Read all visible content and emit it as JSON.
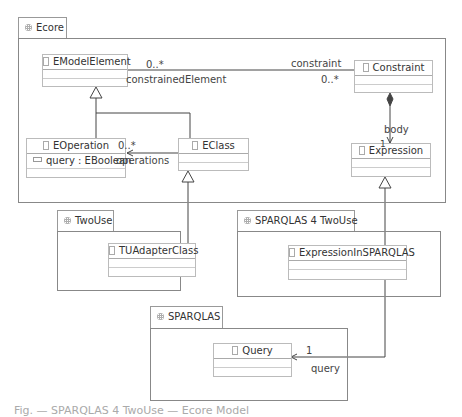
{
  "packages": {
    "ecore": {
      "name": "Ecore"
    },
    "twouse": {
      "name": "TwoUse"
    },
    "sparqlas4twouse": {
      "name": "SPARQLAS 4 TwoUse"
    },
    "sparqlas": {
      "name": "SPARQLAS"
    }
  },
  "classes": {
    "emodelelement": {
      "name": "EModelElement"
    },
    "constraint": {
      "name": "Constraint"
    },
    "eoperation": {
      "name": "EOperation",
      "attributes": [
        "query : EBoolean"
      ]
    },
    "eclass": {
      "name": "EClass"
    },
    "expression": {
      "name": "Expression"
    },
    "tuadapterclass": {
      "name": "TUAdapterClass"
    },
    "expressioninsparqlas": {
      "name": "ExpressionInSPARQLAS"
    },
    "query": {
      "name": "Query"
    }
  },
  "associations": {
    "constraint_assoc": {
      "source_multiplicity": "0..*",
      "source_role": "constrainedElement",
      "target_role": "constraint",
      "target_multiplicity": "0..*"
    },
    "body_assoc": {
      "role": "body",
      "multiplicity": "1"
    },
    "operations_assoc": {
      "multiplicity": "0..*",
      "role": "operations"
    },
    "query_assoc": {
      "multiplicity": "1",
      "role": "query"
    }
  },
  "caption": "Fig. — SPARQLAS 4 TwoUse — Ecore Model"
}
